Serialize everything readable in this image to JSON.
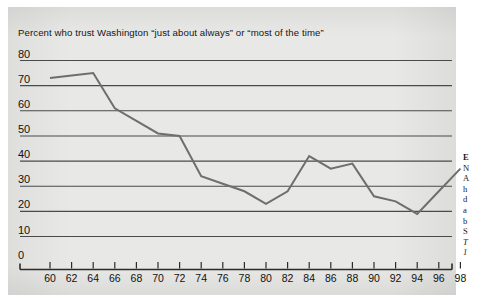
{
  "figure": {
    "title": "Percent who trust Washington “just about always” or “most of the time”",
    "panel_color": "#e8e8e6",
    "line_color": "#6e6e6e",
    "axis_color": "#2b2b2b",
    "grid_color": "#4a4a4a",
    "text_color": "#161616"
  },
  "side_column": {
    "lines": [
      "E",
      "N",
      "A",
      "h",
      "d",
      "a",
      "b",
      "S",
      "T",
      "1"
    ]
  },
  "chart_data": {
    "type": "line",
    "title": "Percent who trust Washington “just about always” or “most of the time”",
    "xlabel": "",
    "ylabel": "",
    "ylim": [
      0,
      80
    ],
    "xlim": [
      60,
      98
    ],
    "ytick_labels": [
      "80",
      "70",
      "60",
      "50",
      "40",
      "30",
      "20",
      "10",
      "0"
    ],
    "yticks": [
      80,
      70,
      60,
      50,
      40,
      30,
      20,
      10,
      0
    ],
    "xtick_labels": [
      "60",
      "62",
      "64",
      "66",
      "68",
      "70",
      "72",
      "74",
      "76",
      "78",
      "80",
      "82",
      "84",
      "86",
      "88",
      "90",
      "92",
      "94",
      "96",
      "98"
    ],
    "xticks": [
      60,
      62,
      64,
      66,
      68,
      70,
      72,
      74,
      76,
      78,
      80,
      82,
      84,
      86,
      88,
      90,
      92,
      94,
      96,
      98
    ],
    "grid": true,
    "grid_axis": "y",
    "legend": false,
    "x": [
      60,
      62,
      64,
      66,
      68,
      70,
      72,
      74,
      76,
      78,
      80,
      82,
      84,
      86,
      88,
      90,
      92,
      94,
      96,
      98
    ],
    "values": [
      73,
      74,
      75,
      61,
      56,
      51,
      50,
      34,
      31,
      28,
      23,
      28,
      42,
      37,
      39,
      26,
      24,
      19,
      28,
      37
    ],
    "series": [
      {
        "name": "Percent who trust Washington just about always or most of the time",
        "values": [
          73,
          74,
          75,
          61,
          56,
          51,
          50,
          34,
          31,
          28,
          23,
          28,
          42,
          37,
          39,
          26,
          24,
          19,
          28,
          37
        ]
      }
    ]
  }
}
